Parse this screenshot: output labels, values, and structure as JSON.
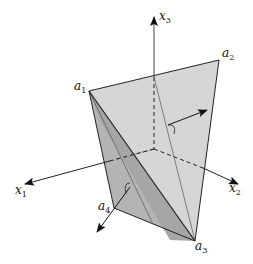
{
  "diagram": {
    "type": "3d-tetrahedron-cone",
    "axes": [
      {
        "id": "x1",
        "base": "x",
        "sub": "1"
      },
      {
        "id": "x2",
        "base": "x",
        "sub": "2"
      },
      {
        "id": "x3",
        "base": "x",
        "sub": "3"
      }
    ],
    "vertices": [
      {
        "id": "a1",
        "base": "a",
        "sub": "1"
      },
      {
        "id": "a2",
        "base": "a",
        "sub": "2"
      },
      {
        "id": "a3",
        "base": "a",
        "sub": "3"
      },
      {
        "id": "a4",
        "base": "a",
        "sub": "4"
      }
    ],
    "colors": {
      "face_light": "#d4d4d4",
      "face_mid": "#c2c2c2",
      "face_dark": "#a9a9a9",
      "edge": "#222222",
      "axis": "#222222"
    }
  }
}
